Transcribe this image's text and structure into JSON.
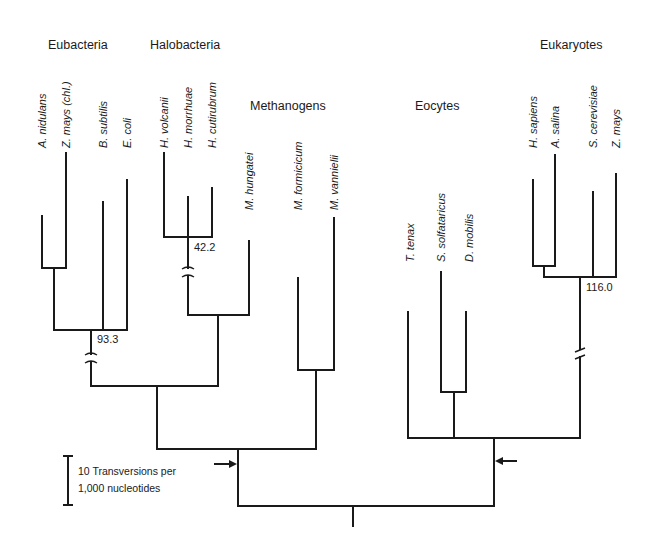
{
  "diagram": {
    "type": "phylogenetic-tree",
    "line_color": "#1a1a1a",
    "groups": [
      {
        "name": "Eubacteria",
        "x": 48,
        "y": 38
      },
      {
        "name": "Halobacteria",
        "x": 150,
        "y": 38
      },
      {
        "name": "Methanogens",
        "x": 250,
        "y": 99
      },
      {
        "name": "Eocytes",
        "x": 415,
        "y": 99
      },
      {
        "name": "Eukaryotes",
        "x": 540,
        "y": 38
      }
    ],
    "taxa": [
      {
        "name": "A. nidulans",
        "group": "Eubacteria",
        "x": 42,
        "label_bottom": 148,
        "branch_top": 216
      },
      {
        "name": "Z. mays (chl.)",
        "group": "Eubacteria",
        "x": 66,
        "label_bottom": 148,
        "branch_top": 153
      },
      {
        "name": "B. subtilis",
        "group": "Eubacteria",
        "x": 103,
        "label_bottom": 148,
        "branch_top": 202
      },
      {
        "name": "E. coli",
        "group": "Eubacteria",
        "x": 127,
        "label_bottom": 148,
        "branch_top": 180
      },
      {
        "name": "H. volcanii",
        "group": "Halobacteria",
        "x": 164,
        "label_bottom": 148,
        "branch_top": 153
      },
      {
        "name": "H. morrhuae",
        "group": "Halobacteria",
        "x": 188,
        "label_bottom": 148,
        "branch_top": 197
      },
      {
        "name": "H. cutirubrum",
        "group": "Halobacteria",
        "x": 212,
        "label_bottom": 148,
        "branch_top": 188
      },
      {
        "name": "M. hungatei",
        "group": "Methanogens",
        "x": 249,
        "label_bottom": 210,
        "branch_top": 241
      },
      {
        "name": "M. formicicum",
        "group": "Methanogens",
        "x": 298,
        "label_bottom": 210,
        "branch_top": 278
      },
      {
        "name": "M. vannielii",
        "group": "Methanogens",
        "x": 334,
        "label_bottom": 210,
        "branch_top": 218
      },
      {
        "name": "T. tenax",
        "group": "Eocytes",
        "x": 408,
        "label_bottom": 262,
        "branch_top": 312
      },
      {
        "name": "S. solfataricus",
        "group": "Eocytes",
        "x": 441,
        "label_bottom": 262,
        "branch_top": 272
      },
      {
        "name": "D. mobilis",
        "group": "Eocytes",
        "x": 466,
        "label_bottom": 262,
        "branch_top": 312
      },
      {
        "name": "H. sapiens",
        "group": "Eukaryotes",
        "x": 533,
        "label_bottom": 148,
        "branch_top": 180
      },
      {
        "name": "A. salina",
        "group": "Eukaryotes",
        "x": 555,
        "label_bottom": 148,
        "branch_top": 155
      },
      {
        "name": "S. cerevisiae",
        "group": "Eukaryotes",
        "x": 593,
        "label_bottom": 148,
        "branch_top": 192
      },
      {
        "name": "Z. mays",
        "group": "Eukaryotes",
        "x": 616,
        "label_bottom": 148,
        "branch_top": 174
      }
    ],
    "node_labels": [
      {
        "text": "93.3",
        "x": 97,
        "y": 333
      },
      {
        "text": "42.2",
        "x": 194,
        "y": 241
      },
      {
        "text": "116.0",
        "x": 586,
        "y": 281
      }
    ],
    "breaks": [
      {
        "x": 91,
        "y": 358,
        "style": "curved"
      },
      {
        "x": 188,
        "y": 272,
        "style": "curved"
      },
      {
        "x": 580,
        "y": 353,
        "style": "slash"
      }
    ],
    "root_arrows": [
      {
        "x1": 215,
        "x2": 236,
        "y": 464,
        "direction": "right"
      },
      {
        "x1": 516,
        "x2": 496,
        "y": 461,
        "direction": "left"
      }
    ],
    "scale_bar": {
      "line1": "10 Transversions per",
      "line2": "1,000 nucleotides",
      "x": 68,
      "y_top": 456,
      "y_bottom": 505
    }
  }
}
